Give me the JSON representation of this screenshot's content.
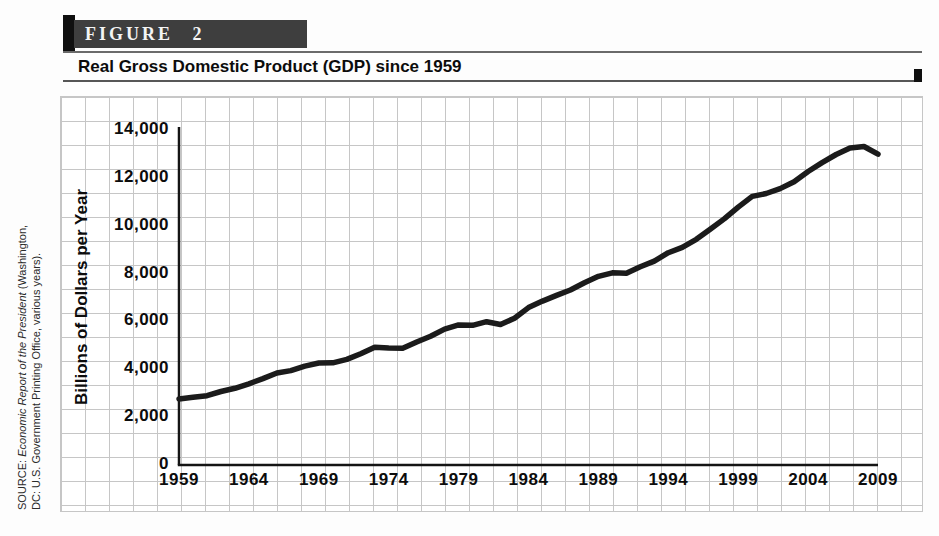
{
  "figure": {
    "label": "FIGURE 2",
    "title": "Real Gross Domestic Product (GDP) since 1959"
  },
  "source_note": {
    "prefix": "SOURCE: ",
    "work_title": "Economic Report of the President",
    "loc1": " (Washington,",
    "loc2": "DC: U.S. Government Printing Office, various years)."
  },
  "chart_data": {
    "type": "line",
    "title": "Real Gross Domestic Product (GDP) since 1959",
    "xlabel": "",
    "ylabel": "Billions of Dollars per Year",
    "x": [
      1959,
      1960,
      1961,
      1962,
      1963,
      1964,
      1965,
      1966,
      1967,
      1968,
      1969,
      1970,
      1971,
      1972,
      1973,
      1974,
      1975,
      1976,
      1977,
      1978,
      1979,
      1980,
      1981,
      1982,
      1983,
      1984,
      1985,
      1986,
      1987,
      1988,
      1989,
      1990,
      1991,
      1992,
      1993,
      1994,
      1995,
      1996,
      1997,
      1998,
      1999,
      2000,
      2001,
      2002,
      2003,
      2004,
      2005,
      2006,
      2007,
      2008,
      2009
    ],
    "values": [
      2762,
      2831,
      2897,
      3072,
      3207,
      3392,
      3610,
      3845,
      3943,
      4133,
      4262,
      4270,
      4413,
      4648,
      4917,
      4890,
      4880,
      5141,
      5378,
      5678,
      5855,
      5839,
      5987,
      5871,
      6136,
      6577,
      6849,
      7087,
      7313,
      7614,
      7886,
      8034,
      8015,
      8287,
      8523,
      8871,
      9094,
      9434,
      9854,
      10284,
      10780,
      11226,
      11347,
      11553,
      11841,
      12264,
      12638,
      12976,
      13254,
      13312,
      12987
    ],
    "xlim": [
      1959,
      2009
    ],
    "ylim": [
      0,
      14000
    ],
    "x_ticks": [
      1959,
      1964,
      1969,
      1974,
      1979,
      1984,
      1989,
      1994,
      1999,
      2004,
      2009
    ],
    "y_ticks": [
      0,
      2000,
      4000,
      6000,
      8000,
      10000,
      12000,
      14000
    ],
    "y_tick_labels": [
      "0",
      "2,000",
      "4,000",
      "6,000",
      "8,000",
      "10,000",
      "12,000",
      "14,000"
    ],
    "grid": true,
    "legend": "none",
    "line_color": "#1b1b1b"
  },
  "colors": {
    "figure_bar_bg": "#3e3e3e",
    "accent_bar": "#0f0f0f",
    "rule": "#565656",
    "grid_line": "#c6c6c6",
    "axis": "#141414",
    "line": "#1b1b1b"
  }
}
